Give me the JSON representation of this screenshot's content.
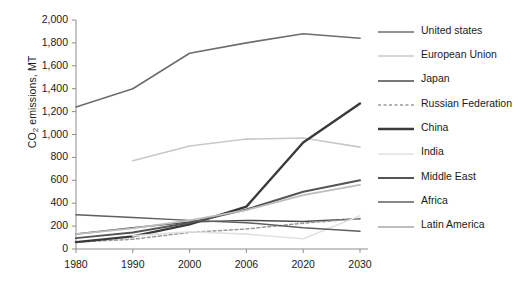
{
  "chart_data": {
    "type": "line",
    "title": "",
    "subtitle": "",
    "xlabel": "",
    "ylabel": "CO2 emissions, MT",
    "ylabel_parts": {
      "prefix": "CO",
      "sub": "2",
      "suffix": " emissions, MT"
    },
    "categories": [
      "1980",
      "1990",
      "2000",
      "2006",
      "2020",
      "2030"
    ],
    "ylim": [
      0,
      2000
    ],
    "yticks": [
      "0",
      "200",
      "400",
      "600",
      "800",
      "1,000",
      "1,200",
      "1,400",
      "1,600",
      "1,800",
      "2,000"
    ],
    "ytick_values": [
      0,
      200,
      400,
      600,
      800,
      1000,
      1200,
      1400,
      1600,
      1800,
      2000
    ],
    "grid": false,
    "legend_position": "right",
    "series": [
      {
        "name": "United states",
        "values": [
          1240,
          1400,
          1710,
          1800,
          1880,
          1840
        ],
        "color": "#6e6e6e",
        "width": 1.6,
        "dash": "none"
      },
      {
        "name": "European Union",
        "values": [
          null,
          770,
          900,
          960,
          970,
          890
        ],
        "color": "#c8c8c8",
        "width": 1.6,
        "dash": "none"
      },
      {
        "name": "Japan",
        "values": [
          130,
          185,
          235,
          250,
          240,
          265
        ],
        "color": "#4a4a4a",
        "width": 1.5,
        "dash": "none"
      },
      {
        "name": "Russian Federation",
        "values": [
          60,
          85,
          145,
          175,
          225,
          265
        ],
        "color": "#9a9a9a",
        "width": 1.5,
        "dash": "dashed"
      },
      {
        "name": "China",
        "values": [
          60,
          110,
          215,
          370,
          930,
          1270
        ],
        "color": "#3a3a3a",
        "width": 2.4,
        "dash": "none"
      },
      {
        "name": "India",
        "values": [
          null,
          115,
          150,
          130,
          90,
          290
        ],
        "color": "#e2e2e2",
        "width": 1.6,
        "dash": "none"
      },
      {
        "name": "Middle East",
        "values": [
          95,
          145,
          230,
          345,
          500,
          600
        ],
        "color": "#555555",
        "width": 2.0,
        "dash": "none"
      },
      {
        "name": "Africa",
        "values": [
          300,
          275,
          250,
          230,
          185,
          155
        ],
        "color": "#5f5f5f",
        "width": 1.5,
        "dash": "none"
      },
      {
        "name": "Latin America",
        "values": [
          130,
          180,
          250,
          340,
          470,
          560
        ],
        "color": "#bdbdbd",
        "width": 1.8,
        "dash": "none"
      }
    ]
  },
  "axis": {
    "line_color": "#8c8c8c"
  }
}
